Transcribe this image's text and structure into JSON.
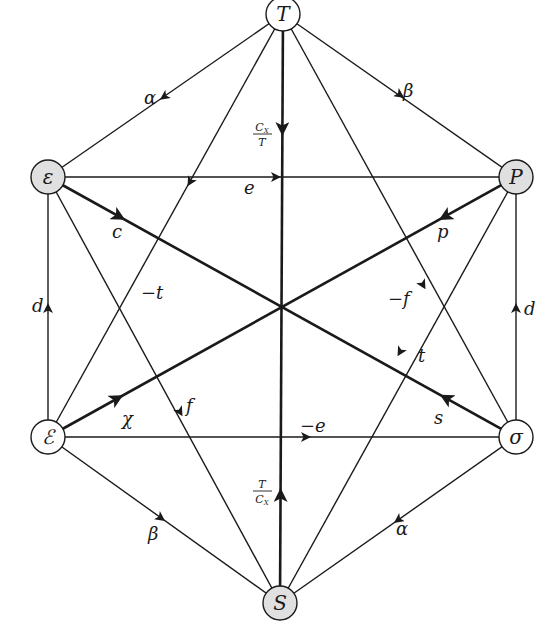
{
  "diagram": {
    "type": "thermodynamic-hexagon",
    "colors": {
      "line": "#1a1a1a",
      "shaded_node": "#e0e0e0",
      "open_node": "#ffffff",
      "background": "#ffffff"
    },
    "nodes": [
      {
        "id": "T",
        "label": "T",
        "x": 283,
        "y": 14,
        "shaded": false
      },
      {
        "id": "eps",
        "label": "ε",
        "x": 48,
        "y": 177,
        "shaded": true
      },
      {
        "id": "P",
        "label": "P",
        "x": 516,
        "y": 177,
        "shaded": true
      },
      {
        "id": "Eps",
        "label": "ℰ",
        "x": 48,
        "y": 437,
        "shaded": false
      },
      {
        "id": "sigma",
        "label": "σ",
        "x": 516,
        "y": 437,
        "shaded": false
      },
      {
        "id": "S",
        "label": "S",
        "x": 280,
        "y": 603,
        "shaded": true
      }
    ],
    "edges": [
      {
        "from": "T",
        "to": "eps",
        "label": "α",
        "thick": false
      },
      {
        "from": "T",
        "to": "P",
        "label": "β",
        "thick": false
      },
      {
        "from": "eps",
        "to": "P",
        "label": "e",
        "thick": false
      },
      {
        "from": "eps",
        "to": "sigma",
        "label": "c",
        "thick": true
      },
      {
        "from": "sigma",
        "to": "eps",
        "label": "s",
        "thick": true
      },
      {
        "from": "Eps",
        "to": "eps",
        "label": "d",
        "thick": false
      },
      {
        "from": "eps",
        "to": "S",
        "label": "f",
        "thick": false
      },
      {
        "from": "T",
        "to": "S",
        "label": "C_X/T",
        "thick": true
      },
      {
        "from": "S",
        "to": "T",
        "label": "T/C_X",
        "thick": true
      },
      {
        "from": "T",
        "to": "Eps",
        "label": "−t",
        "thick": false
      },
      {
        "from": "T",
        "to": "sigma",
        "label": "−f",
        "thick": false
      },
      {
        "from": "P",
        "to": "Eps",
        "label": "p",
        "thick": true
      },
      {
        "from": "Eps",
        "to": "P",
        "label": "χ",
        "thick": true
      },
      {
        "from": "P",
        "to": "S",
        "label": "t",
        "thick": false
      },
      {
        "from": "sigma",
        "to": "P",
        "label": "d",
        "thick": false
      },
      {
        "from": "Eps",
        "to": "sigma",
        "label": "−e",
        "thick": false
      },
      {
        "from": "Eps",
        "to": "S",
        "label": "β",
        "thick": false
      },
      {
        "from": "sigma",
        "to": "S",
        "label": "α",
        "thick": false
      }
    ],
    "edge_labels": {
      "alpha_top": "α",
      "beta_top": "β",
      "e": "e",
      "c": "c",
      "p": "p",
      "d_left": "d",
      "d_right": "d",
      "neg_t": "−t",
      "neg_f": "−f",
      "t": "t",
      "f": "f",
      "chi": "χ",
      "s": "s",
      "neg_e": "−e",
      "beta_bottom": "β",
      "alpha_bottom": "α",
      "frac_top_num": "C",
      "frac_top_sub": "X",
      "frac_top_den": "T",
      "frac_bot_num": "T",
      "frac_bot_den": "C",
      "frac_bot_sub": "X"
    }
  }
}
